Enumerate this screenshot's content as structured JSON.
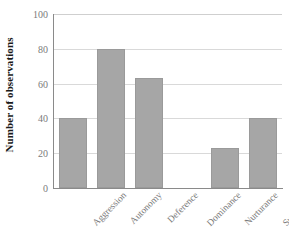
{
  "chart_data": {
    "type": "bar",
    "title": "",
    "xlabel": "",
    "ylabel": "Number of observations",
    "categories": [
      "Aggression",
      "Autonomy",
      "Deference",
      "Dominance",
      "Nurturance",
      "Succorance"
    ],
    "values": [
      40,
      80,
      63,
      0,
      23,
      40
    ],
    "ylim": [
      0,
      100
    ],
    "yticks": [
      0,
      20,
      40,
      60,
      80,
      100
    ],
    "ytick_labels": [
      "0",
      "20",
      "40",
      "60",
      "80",
      "100"
    ],
    "grid": true,
    "grid_axis": "y",
    "legend": false,
    "legend_position": "none",
    "bar_color": "#a6a6a6",
    "bar_edge_color": "#9a9a9a",
    "grid_color": "#d9d9d9",
    "axis_color": "#8a8a8a",
    "tick_label_color": "#7a7a7a",
    "axis_title_color": "#1a1a1a"
  }
}
